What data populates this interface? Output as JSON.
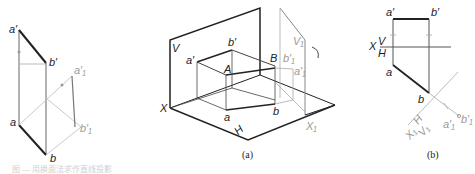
{
  "figures": {
    "left": {
      "labels": {
        "a_prime": "a′",
        "b_prime": "b′",
        "a1_prime": "a′₁",
        "b1_prime": "b′₁",
        "a": "a",
        "b": "b"
      }
    },
    "a": {
      "caption": "(a)",
      "labels": {
        "V": "V",
        "X": "X",
        "H": "H",
        "a_prime": "a′",
        "b_prime": "b′",
        "A": "A",
        "B": "B",
        "a": "a",
        "b": "b",
        "V1": "V₁",
        "b1_prime": "b′₁",
        "a1_prime": "a′₁",
        "X1": "X₁"
      }
    },
    "b": {
      "caption": "(b)",
      "labels": {
        "a_prime": "a′",
        "b_prime": "b′",
        "X": "X",
        "V": "V",
        "H": "H",
        "a": "a",
        "b": "b",
        "X1": "X₁",
        "H_sub": "H",
        "V1": "V₁",
        "a1_prime": "a′₁",
        "b1_prime": "b′₁"
      }
    }
  },
  "footer_text": "图 — 用换面法求作直线投影"
}
